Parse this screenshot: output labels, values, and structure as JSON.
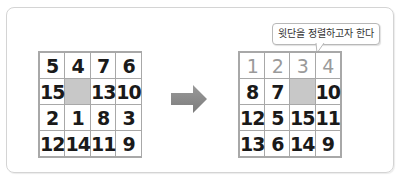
{
  "callout": {
    "text": "윗단을 정렬하고자 한다"
  },
  "colors": {
    "empty_cell": "#c8c8c8",
    "arrow": "#8c8c8c",
    "sorted_text": "#9a9a9a",
    "grid_border": "#a8a8a8"
  },
  "left_grid": {
    "cells": [
      "5",
      "4",
      "7",
      "6",
      "15",
      "",
      "13",
      "10",
      "2",
      "1",
      "8",
      "3",
      "12",
      "14",
      "11",
      "9"
    ]
  },
  "right_grid": {
    "cells": [
      "1",
      "2",
      "3",
      "4",
      "8",
      "7",
      "",
      "10",
      "12",
      "5",
      "15",
      "11",
      "13",
      "6",
      "14",
      "9"
    ]
  }
}
